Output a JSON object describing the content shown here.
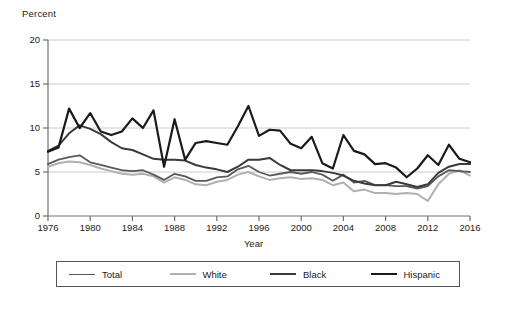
{
  "chart_data": {
    "type": "line",
    "title": "",
    "ylabel": "Percent",
    "xlabel": "Year",
    "ylim": [
      0,
      20
    ],
    "yticks": [
      0,
      5,
      10,
      15,
      20
    ],
    "xlim": [
      1976,
      2016
    ],
    "xticks": [
      1976,
      1980,
      1984,
      1988,
      1992,
      1996,
      2000,
      2004,
      2008,
      2012,
      2016
    ],
    "grid": "horizontal",
    "legend_position": "bottom",
    "x": [
      1976,
      1977,
      1978,
      1979,
      1980,
      1981,
      1982,
      1983,
      1984,
      1985,
      1986,
      1987,
      1988,
      1989,
      1990,
      1991,
      1992,
      1993,
      1994,
      1995,
      1996,
      1997,
      1998,
      1999,
      2000,
      2001,
      2002,
      2003,
      2004,
      2005,
      2006,
      2007,
      2008,
      2009,
      2010,
      2011,
      2012,
      2013,
      2014,
      2015,
      2016
    ],
    "series": [
      {
        "name": "Total",
        "color": "#595959",
        "width": 1.8,
        "values": [
          5.9,
          6.4,
          6.7,
          6.9,
          6.1,
          5.8,
          5.5,
          5.2,
          5.1,
          5.2,
          4.7,
          4.1,
          4.8,
          4.5,
          4.0,
          4.0,
          4.4,
          4.5,
          5.3,
          5.7,
          5.0,
          4.6,
          4.8,
          5.0,
          4.8,
          5.0,
          4.7,
          4.0,
          4.7,
          3.8,
          4.0,
          3.5,
          3.5,
          3.4,
          3.4,
          3.1,
          3.4,
          4.5,
          5.2,
          5.1,
          5.0
        ]
      },
      {
        "name": "White",
        "color": "#b0b0b0",
        "width": 2.0,
        "values": [
          5.6,
          6.0,
          6.2,
          6.1,
          5.8,
          5.4,
          5.1,
          4.8,
          4.7,
          4.8,
          4.5,
          3.8,
          4.4,
          4.1,
          3.6,
          3.5,
          3.9,
          4.1,
          4.7,
          5.0,
          4.5,
          4.1,
          4.3,
          4.4,
          4.2,
          4.3,
          4.1,
          3.5,
          3.8,
          2.8,
          3.0,
          2.6,
          2.6,
          2.5,
          2.6,
          2.5,
          1.7,
          3.6,
          4.8,
          5.2,
          4.6
        ]
      },
      {
        "name": "Black",
        "color": "#3a3a3a",
        "width": 2.0,
        "values": [
          7.4,
          8.0,
          9.4,
          10.3,
          9.9,
          9.3,
          8.4,
          7.7,
          7.5,
          7.0,
          6.5,
          6.4,
          6.4,
          6.3,
          5.8,
          5.5,
          5.3,
          5.0,
          5.6,
          6.4,
          6.4,
          6.6,
          5.8,
          5.2,
          5.2,
          5.2,
          5.1,
          4.9,
          4.6,
          4.0,
          3.7,
          3.5,
          3.5,
          3.9,
          3.6,
          3.3,
          3.6,
          4.9,
          5.6,
          5.9,
          5.9
        ]
      },
      {
        "name": "Hispanic",
        "color": "#1a1a1a",
        "width": 2.2,
        "values": [
          7.3,
          7.8,
          12.2,
          10.0,
          11.7,
          9.6,
          9.2,
          9.6,
          11.1,
          10.0,
          12.0,
          5.6,
          11.0,
          6.4,
          8.3,
          8.5,
          8.3,
          8.1,
          10.2,
          12.5,
          9.1,
          9.8,
          9.7,
          8.2,
          7.7,
          9.0,
          6.0,
          5.4,
          9.2,
          7.4,
          7.0,
          5.9,
          6.0,
          5.5,
          4.4,
          5.4,
          6.9,
          5.8,
          8.1,
          6.5,
          6.1
        ]
      }
    ]
  },
  "legend": {
    "items": [
      {
        "label": "Total",
        "color": "#595959",
        "width": 1.8
      },
      {
        "label": "White",
        "color": "#b0b0b0",
        "width": 2.0
      },
      {
        "label": "Black",
        "color": "#3a3a3a",
        "width": 2.0
      },
      {
        "label": "Hispanic",
        "color": "#1a1a1a",
        "width": 2.2
      }
    ]
  },
  "axes": {
    "y_title": "Percent",
    "x_title": "Year",
    "axis_color": "#808080",
    "grid_color": "#cccccc"
  }
}
